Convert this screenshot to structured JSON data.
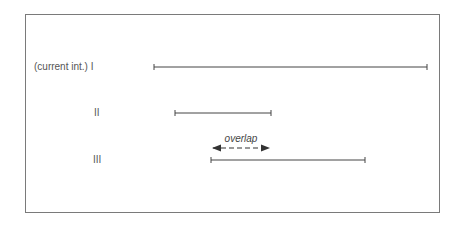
{
  "diagram": {
    "intervals": [
      {
        "id": "I",
        "label": "(current int.) I",
        "label_x": 34,
        "y": 67,
        "x1": 154,
        "x2": 427
      },
      {
        "id": "II",
        "label": "II",
        "label_x": 94,
        "y": 113,
        "x1": 175,
        "x2": 271
      },
      {
        "id": "III",
        "label": "III",
        "label_x": 93,
        "y": 160,
        "x1": 211,
        "x2": 365
      }
    ],
    "overlap": {
      "label": "overlap",
      "x1": 211,
      "x2": 271,
      "y": 148,
      "label_y": 133
    },
    "colors": {
      "line": "#444444",
      "frame": "#7a7a7a",
      "text": "#555555"
    }
  }
}
